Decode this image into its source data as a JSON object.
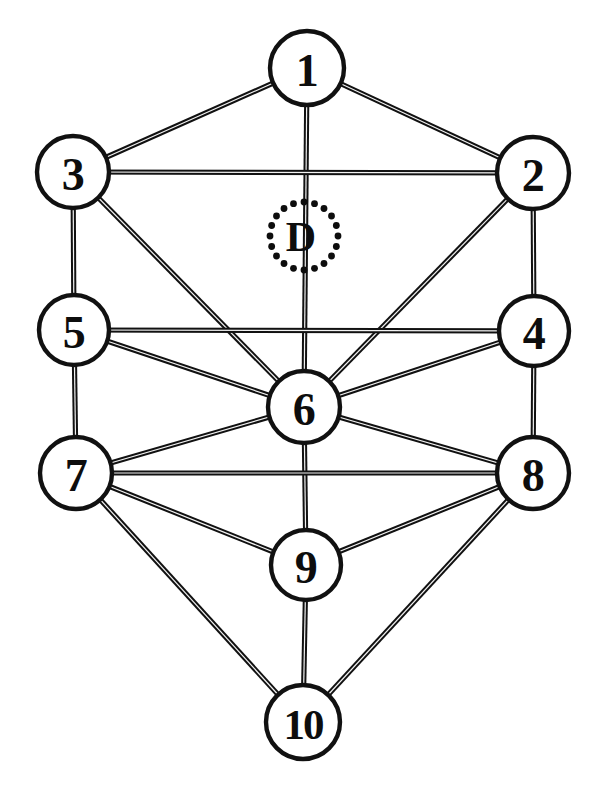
{
  "diagram": {
    "type": "node-link-graph",
    "canvas": {
      "width": 606,
      "height": 789
    },
    "style": {
      "background_color": "#ffffff",
      "node_fill": "#ffffff",
      "node_stroke": "#111111",
      "node_stroke_width": 4.4,
      "edge_color": "#111111",
      "edge_width": 5.2,
      "edge_inner_color": "#f2f2f2",
      "edge_inner_width": 1.2,
      "label_color": "#0d0d0d"
    },
    "nodes": [
      {
        "id": "1",
        "label": "1",
        "cx": 307,
        "cy": 68,
        "r": 37,
        "wide": false
      },
      {
        "id": "3",
        "label": "3",
        "cx": 73,
        "cy": 172,
        "r": 36,
        "wide": false
      },
      {
        "id": "2",
        "label": "2",
        "cx": 533,
        "cy": 173,
        "r": 36,
        "wide": false
      },
      {
        "id": "5",
        "label": "5",
        "cx": 74,
        "cy": 330,
        "r": 35,
        "wide": false
      },
      {
        "id": "4",
        "label": "4",
        "cx": 534,
        "cy": 331,
        "r": 35,
        "wide": false
      },
      {
        "id": "6",
        "label": "6",
        "cx": 304,
        "cy": 407,
        "r": 36,
        "wide": false
      },
      {
        "id": "7",
        "label": "7",
        "cx": 76,
        "cy": 473,
        "r": 36,
        "wide": false
      },
      {
        "id": "8",
        "label": "8",
        "cx": 533,
        "cy": 473,
        "r": 36,
        "wide": false
      },
      {
        "id": "9",
        "label": "9",
        "cx": 306,
        "cy": 565,
        "r": 35,
        "wide": false
      },
      {
        "id": "10",
        "label": "10",
        "cx": 303,
        "cy": 722,
        "r": 37,
        "wide": true
      }
    ],
    "hidden_node": {
      "id": "D",
      "label": "D",
      "cx": 304,
      "cy": 236,
      "r": 34,
      "style": "dotted-outline",
      "dot_count": 20,
      "dot_radius": 3.4
    },
    "edges": [
      {
        "from": "1",
        "to": "3"
      },
      {
        "from": "1",
        "to": "2"
      },
      {
        "from": "1",
        "to": "6",
        "note": "vertical through D"
      },
      {
        "from": "3",
        "to": "2"
      },
      {
        "from": "3",
        "to": "5"
      },
      {
        "from": "3",
        "to": "6"
      },
      {
        "from": "2",
        "to": "4"
      },
      {
        "from": "2",
        "to": "6"
      },
      {
        "from": "5",
        "to": "4"
      },
      {
        "from": "5",
        "to": "6"
      },
      {
        "from": "5",
        "to": "7"
      },
      {
        "from": "4",
        "to": "6"
      },
      {
        "from": "4",
        "to": "8"
      },
      {
        "from": "6",
        "to": "7"
      },
      {
        "from": "6",
        "to": "8"
      },
      {
        "from": "6",
        "to": "9"
      },
      {
        "from": "7",
        "to": "8"
      },
      {
        "from": "7",
        "to": "9"
      },
      {
        "from": "7",
        "to": "10"
      },
      {
        "from": "8",
        "to": "9"
      },
      {
        "from": "8",
        "to": "10"
      },
      {
        "from": "9",
        "to": "10"
      }
    ]
  }
}
